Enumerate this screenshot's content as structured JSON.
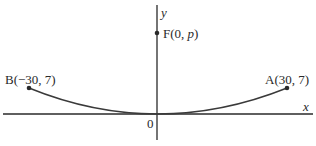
{
  "diagram": {
    "type": "parabola",
    "axes": {
      "x_label": "x",
      "y_label": "y",
      "origin_label": "0"
    },
    "points": {
      "focus": {
        "name": "F",
        "label_prefix": "F(0, ",
        "label_var": "p",
        "label_suffix": ")"
      },
      "A": {
        "label": "A(30, 7)",
        "x": 30,
        "y": 7
      },
      "B": {
        "label": "B(−30, 7)",
        "x": -30,
        "y": 7
      }
    },
    "colors": {
      "ink": "#2a2a2a",
      "background": "#ffffff"
    }
  }
}
